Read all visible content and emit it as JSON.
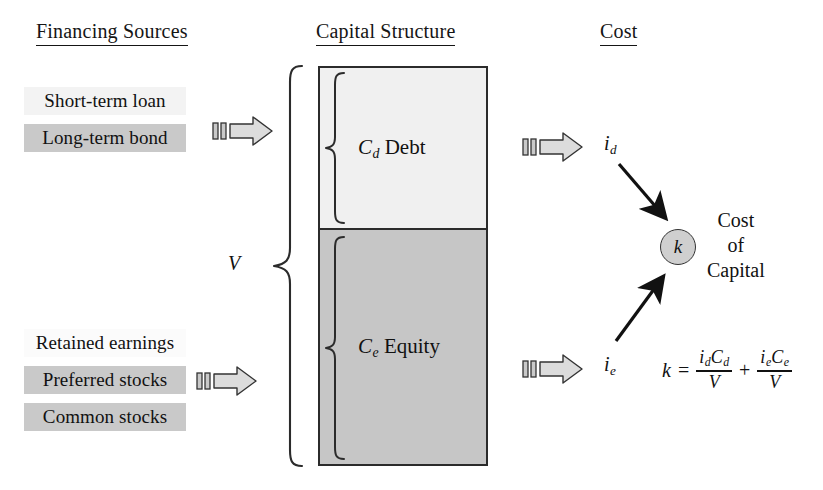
{
  "figure": {
    "columns": [
      {
        "id": "financing-sources",
        "label": "Financing Sources"
      },
      {
        "id": "capital-structure",
        "label": "Capital Structure"
      },
      {
        "id": "cost",
        "label": "Cost"
      }
    ]
  },
  "financing_sources": {
    "debt_group": [
      {
        "label": "Short-term loan",
        "shade": "#f3f3f3"
      },
      {
        "label": "Long-term bond",
        "shade": "#c9c9c9"
      }
    ],
    "equity_group": [
      {
        "label": "Retained earnings",
        "shade": "#fbfbfb"
      },
      {
        "label": "Preferred stocks",
        "shade": "#c9c9c9"
      },
      {
        "label": "Common stocks",
        "shade": "#c9c9c9"
      }
    ]
  },
  "capital_structure": {
    "total_label": "V",
    "segments": [
      {
        "id": "debt",
        "symbol": "C",
        "subscript": "d",
        "name": "Debt",
        "fill": "#f0f0f0",
        "share_percent": 40
      },
      {
        "id": "equity",
        "symbol": "C",
        "subscript": "e",
        "name": "Equity",
        "fill": "#c6c6c6",
        "share_percent": 60
      }
    ]
  },
  "cost": {
    "debt_rate": {
      "symbol": "i",
      "subscript": "d"
    },
    "equity_rate": {
      "symbol": "i",
      "subscript": "e"
    },
    "node": {
      "symbol": "k",
      "fill": "#cfcfcf"
    },
    "node_caption_lines": [
      "Cost",
      "of",
      "Capital"
    ],
    "formula": {
      "lhs": "k",
      "equals": "=",
      "plus": "+",
      "term1": {
        "numerator_symbols": [
          "i",
          "C"
        ],
        "numerator_subs": [
          "d",
          "d"
        ],
        "denominator": "V"
      },
      "term2": {
        "numerator_symbols": [
          "i",
          "C"
        ],
        "numerator_subs": [
          "e",
          "e"
        ],
        "denominator": "V"
      }
    }
  },
  "icons": {
    "block_arrow": "block-arrow-right-icon",
    "brace": "curly-brace-icon",
    "flow_arrow": "flow-arrow-icon"
  }
}
